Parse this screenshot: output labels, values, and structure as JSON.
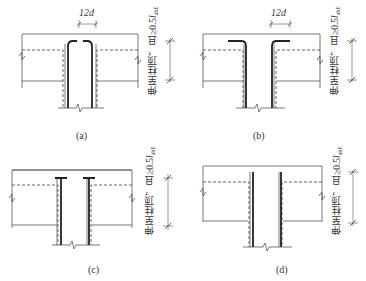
{
  "figure": {
    "panels": [
      {
        "id": "a",
        "caption": "(a)",
        "dimension_label": "12d",
        "vertical_note": "伸至柱顶，且≥0.5",
        "vertical_note_symbol": "l",
        "vertical_note_subscript": "abE",
        "bar_end_detail": "bars hooked inward (12d) over column top"
      },
      {
        "id": "b",
        "caption": "(b)",
        "dimension_label": "12d",
        "vertical_note": "伸至柱顶，且≥0.5",
        "vertical_note_symbol": "l",
        "vertical_note_subscript": "abE",
        "bar_end_detail": "bars hooked outward (12d) over column top"
      },
      {
        "id": "c",
        "caption": "(c)",
        "vertical_note": "伸至柱顶，且≥0.5",
        "vertical_note_symbol": "l",
        "vertical_note_subscript": "abE",
        "bar_end_detail": "bars with anchor plates at top"
      },
      {
        "id": "d",
        "caption": "(d)",
        "vertical_note": "伸至柱顶，且≥0.5",
        "vertical_note_symbol": "l",
        "vertical_note_subscript": "abE",
        "bar_end_detail": "straight bars extended to column top"
      }
    ],
    "colors": {
      "line": "#555555",
      "bar": "#222222",
      "background": "#ffffff"
    }
  }
}
